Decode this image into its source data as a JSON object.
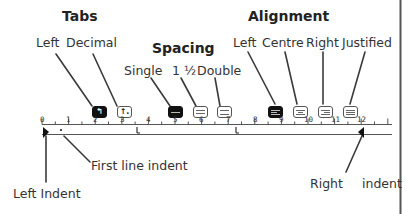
{
  "groups": {
    "tabs": {
      "title": "Tabs",
      "labels": [
        "Left",
        "Decimal"
      ]
    },
    "spacing": {
      "title": "Spacing",
      "labels": [
        "Single",
        "1 ½",
        "Double"
      ]
    },
    "alignment": {
      "title": "Alignment",
      "labels": [
        "Left",
        "Centre",
        "Right",
        "Justified"
      ]
    }
  },
  "buttons": {
    "tab_left": {
      "glyph": "↰",
      "active": true
    },
    "tab_decimal": {
      "glyph": "↑.",
      "active": false
    },
    "spacing_single": {
      "active": true
    },
    "spacing_one_half": {
      "active": false
    },
    "spacing_double": {
      "active": false
    },
    "align_left": {
      "active": true
    },
    "align_centre": {
      "active": false
    },
    "align_right": {
      "active": false
    },
    "align_justified": {
      "active": false
    }
  },
  "ruler": {
    "numbers": [
      "0",
      "1",
      "2",
      "3",
      "4",
      "5",
      "6",
      "7",
      "8",
      "9",
      "10",
      "11",
      "12"
    ],
    "markers": [
      "left-indent",
      "first-line-indent",
      "tab-stop",
      "tab-stop",
      "right-indent"
    ]
  },
  "annotations": {
    "first_line_indent": "First line indent",
    "left_indent": "Left Indent",
    "right_indent_a": "Right",
    "right_indent_b": "indent"
  },
  "colors": {
    "ink": "#222222",
    "line": "#444444",
    "border": "#555555",
    "background": "#ffffff"
  }
}
